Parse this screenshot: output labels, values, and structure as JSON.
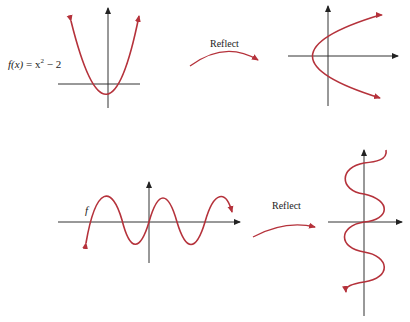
{
  "panels": {
    "top_left": {
      "label_fx": "f(x)",
      "label_eq": " = x",
      "label_sup": "2",
      "label_tail": " − 2"
    },
    "top_arrow": {
      "label": "Reflect"
    },
    "bottom_left": {
      "label": "f"
    },
    "bottom_arrow": {
      "label": "Reflect"
    }
  },
  "colors": {
    "curve": "#b5323b",
    "axis": "#333333"
  }
}
